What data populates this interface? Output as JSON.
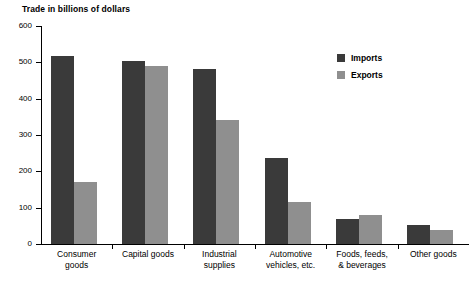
{
  "chart_data": {
    "type": "bar",
    "title": "Trade in billions of dollars",
    "xlabel": "",
    "ylabel": "",
    "ylim": [
      0,
      600
    ],
    "yticks": [
      0,
      100,
      200,
      300,
      400,
      500,
      600
    ],
    "grid": false,
    "legend_position": "top-right",
    "categories": [
      "Consumer\ngoods",
      "Capital goods",
      "Industrial\nsupplies",
      "Automotive\nvehicles, etc.",
      "Foods, feeds,\n& beverages",
      "Other goods"
    ],
    "series": [
      {
        "name": "Imports",
        "color": "#3a3a3a",
        "values": [
          518,
          505,
          483,
          237,
          70,
          52
        ]
      },
      {
        "name": "Exports",
        "color": "#8f8f8f",
        "values": [
          170,
          490,
          340,
          115,
          80,
          38
        ]
      }
    ]
  },
  "legend": {
    "items": [
      {
        "label": "Imports"
      },
      {
        "label": "Exports"
      }
    ]
  }
}
